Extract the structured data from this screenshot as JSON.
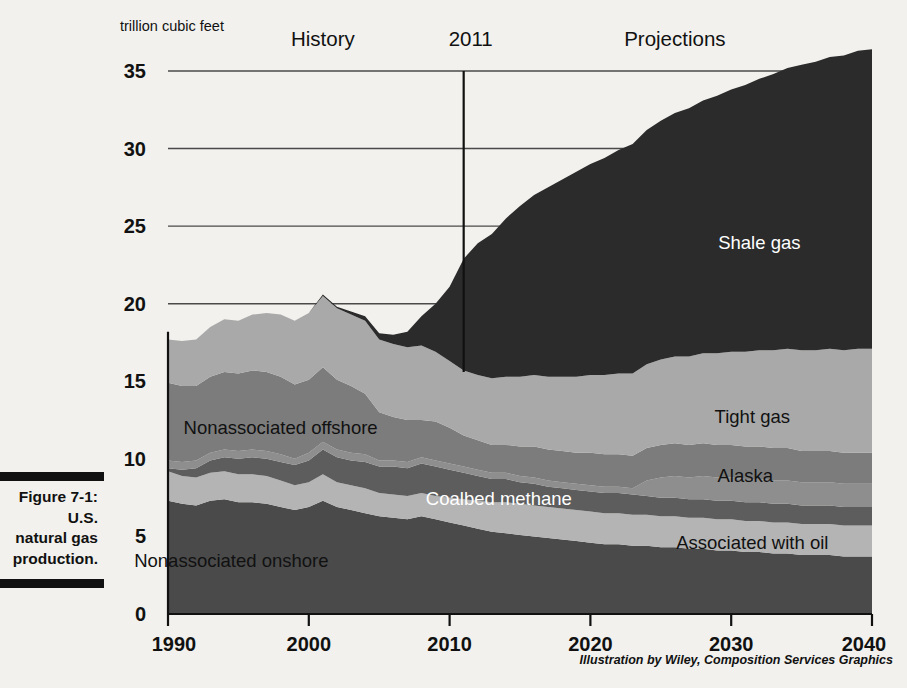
{
  "figure": {
    "caption_label": "Figure 7-1:",
    "caption_line2": "U.S.",
    "caption_line3": "natural gas",
    "caption_line4": "production."
  },
  "credit": "Illustration by Wiley, Composition Services Graphics",
  "chart_data": {
    "type": "area",
    "title": "",
    "subtitle": "",
    "unit_label": "trillion cubic feet",
    "xlabel": "",
    "ylabel": "trillion cubic feet",
    "xlim": [
      1990,
      2040
    ],
    "ylim": [
      0,
      35
    ],
    "xticks": [
      1990,
      2000,
      2010,
      2020,
      2030,
      2040
    ],
    "xtick_labels": [
      "1990",
      "2000",
      "2010",
      "2020",
      "2030",
      "2040"
    ],
    "yticks": [
      0,
      5,
      10,
      15,
      20,
      25,
      30,
      35
    ],
    "ytick_labels": [
      "0",
      "5",
      "10",
      "15",
      "20",
      "25",
      "30",
      "35"
    ],
    "gridlines_at": [
      20,
      25,
      30,
      35
    ],
    "grid": true,
    "legend_position": "inline-annotations",
    "stacked": true,
    "annotations": [
      {
        "name": "history-label",
        "text": "History",
        "x": 2001,
        "y": 36.6
      },
      {
        "name": "projections-label",
        "text": "Projections",
        "x": 2026,
        "y": 36.6
      },
      {
        "name": "divider-year-label",
        "text": "2011",
        "x": 2011.5,
        "y": 36.6
      }
    ],
    "divider_year": 2011,
    "x": [
      1990,
      1991,
      1992,
      1993,
      1994,
      1995,
      1996,
      1997,
      1998,
      1999,
      2000,
      2001,
      2002,
      2003,
      2004,
      2005,
      2006,
      2007,
      2008,
      2009,
      2010,
      2011,
      2012,
      2013,
      2014,
      2015,
      2016,
      2017,
      2018,
      2019,
      2020,
      2021,
      2022,
      2023,
      2024,
      2025,
      2026,
      2027,
      2028,
      2029,
      2030,
      2031,
      2032,
      2033,
      2034,
      2035,
      2036,
      2037,
      2038,
      2039,
      2040
    ],
    "series": [
      {
        "name": "Nonassociated onshore",
        "color": "#4a4a4a",
        "label_color": "dark",
        "label_x": 1994.5,
        "label_y": 3.0,
        "values": [
          7.3,
          7.1,
          7.0,
          7.3,
          7.4,
          7.2,
          7.2,
          7.1,
          6.9,
          6.7,
          6.9,
          7.3,
          6.9,
          6.7,
          6.5,
          6.3,
          6.2,
          6.1,
          6.3,
          6.1,
          5.9,
          5.7,
          5.5,
          5.3,
          5.2,
          5.1,
          5.0,
          4.9,
          4.8,
          4.7,
          4.6,
          4.5,
          4.5,
          4.4,
          4.4,
          4.3,
          4.3,
          4.2,
          4.2,
          4.1,
          4.1,
          4.0,
          4.0,
          3.9,
          3.9,
          3.8,
          3.8,
          3.8,
          3.7,
          3.7,
          3.7
        ]
      },
      {
        "name": "Associated with oil",
        "color": "#b4b4b4",
        "label_color": "dark",
        "label_x": 2031.5,
        "label_y": 4.2,
        "values": [
          1.9,
          1.8,
          1.8,
          1.8,
          1.8,
          1.8,
          1.8,
          1.8,
          1.7,
          1.6,
          1.6,
          1.7,
          1.6,
          1.6,
          1.6,
          1.5,
          1.5,
          1.5,
          1.5,
          1.5,
          1.6,
          1.7,
          1.8,
          1.9,
          2.0,
          2.0,
          2.0,
          2.0,
          2.0,
          2.0,
          2.0,
          2.0,
          2.0,
          2.0,
          2.0,
          2.0,
          2.0,
          2.0,
          2.0,
          2.0,
          2.0,
          2.0,
          2.0,
          2.0,
          2.0,
          2.0,
          2.0,
          2.0,
          2.0,
          2.0,
          2.0
        ]
      },
      {
        "name": "Coalbed methane",
        "color": "#5d5d5d",
        "label_color": "light",
        "label_x": 2013.5,
        "label_y": 7.0,
        "values": [
          0.2,
          0.4,
          0.6,
          0.8,
          0.9,
          1.0,
          1.1,
          1.1,
          1.2,
          1.3,
          1.4,
          1.6,
          1.6,
          1.6,
          1.7,
          1.7,
          1.8,
          1.8,
          1.9,
          1.9,
          1.8,
          1.7,
          1.6,
          1.5,
          1.5,
          1.4,
          1.4,
          1.3,
          1.3,
          1.3,
          1.3,
          1.3,
          1.3,
          1.3,
          1.2,
          1.2,
          1.2,
          1.2,
          1.2,
          1.2,
          1.2,
          1.2,
          1.2,
          1.2,
          1.2,
          1.2,
          1.2,
          1.2,
          1.2,
          1.2,
          1.2
        ]
      },
      {
        "name": "Alaska",
        "color": "#8e8e8e",
        "label_color": "dark",
        "label_x": 2031.0,
        "label_y": 8.5,
        "values": [
          0.5,
          0.5,
          0.5,
          0.5,
          0.5,
          0.5,
          0.5,
          0.5,
          0.5,
          0.4,
          0.5,
          0.5,
          0.5,
          0.5,
          0.5,
          0.4,
          0.4,
          0.4,
          0.4,
          0.4,
          0.4,
          0.4,
          0.4,
          0.4,
          0.4,
          0.4,
          0.4,
          0.4,
          0.4,
          0.4,
          0.4,
          0.4,
          0.4,
          0.4,
          1.0,
          1.3,
          1.4,
          1.4,
          1.5,
          1.5,
          1.5,
          1.5,
          1.5,
          1.5,
          1.5,
          1.5,
          1.5,
          1.5,
          1.5,
          1.5,
          1.5
        ]
      },
      {
        "name": "Nonassociated offshore",
        "color": "#7c7c7c",
        "label_color": "dark",
        "label_x": 1998.0,
        "label_y": 11.6,
        "values": [
          5.0,
          4.9,
          4.8,
          4.9,
          5.0,
          5.0,
          5.1,
          5.1,
          5.0,
          4.8,
          4.7,
          4.8,
          4.5,
          4.3,
          3.9,
          3.1,
          2.8,
          2.7,
          2.4,
          2.5,
          2.3,
          2.0,
          1.9,
          1.8,
          1.8,
          1.9,
          2.0,
          2.0,
          2.0,
          2.0,
          2.1,
          2.1,
          2.1,
          2.1,
          2.1,
          2.1,
          2.1,
          2.1,
          2.1,
          2.1,
          2.1,
          2.1,
          2.1,
          2.1,
          2.1,
          2.0,
          2.0,
          2.0,
          2.0,
          2.0,
          2.0
        ]
      },
      {
        "name": "Tight gas",
        "color": "#a9a9a9",
        "label_color": "dark",
        "label_x": 2031.5,
        "label_y": 12.3,
        "values": [
          2.8,
          2.9,
          3.0,
          3.2,
          3.4,
          3.4,
          3.6,
          3.8,
          4.0,
          4.1,
          4.3,
          4.6,
          4.6,
          4.6,
          4.7,
          4.7,
          4.7,
          4.7,
          4.8,
          4.5,
          4.3,
          4.2,
          4.2,
          4.3,
          4.4,
          4.5,
          4.6,
          4.7,
          4.8,
          4.9,
          5.0,
          5.1,
          5.2,
          5.3,
          5.4,
          5.5,
          5.6,
          5.7,
          5.8,
          5.9,
          6.0,
          6.1,
          6.2,
          6.3,
          6.4,
          6.5,
          6.5,
          6.6,
          6.6,
          6.7,
          6.7
        ]
      },
      {
        "name": "Shale gas",
        "color": "#2b2b2b",
        "label_color": "light",
        "label_x": 2032.0,
        "label_y": 23.5,
        "values": [
          0.0,
          0.0,
          0.0,
          0.0,
          0.0,
          0.0,
          0.0,
          0.0,
          0.0,
          0.0,
          0.0,
          0.1,
          0.1,
          0.2,
          0.3,
          0.4,
          0.6,
          1.0,
          1.9,
          3.1,
          4.8,
          7.2,
          8.5,
          9.3,
          10.2,
          11.0,
          11.6,
          12.2,
          12.7,
          13.2,
          13.6,
          14.0,
          14.4,
          14.8,
          15.1,
          15.4,
          15.7,
          16.0,
          16.3,
          16.6,
          16.9,
          17.2,
          17.5,
          17.8,
          18.1,
          18.4,
          18.6,
          18.8,
          19.0,
          19.2,
          19.3
        ]
      }
    ]
  }
}
